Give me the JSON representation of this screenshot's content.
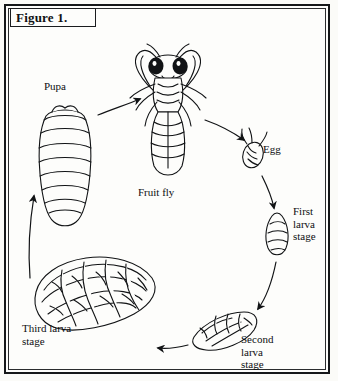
{
  "figure": {
    "label": "Figure 1."
  },
  "diagram": {
    "type": "life-cycle",
    "stages": [
      {
        "id": "pupa",
        "label": "Pupa",
        "x": 62,
        "y": 88
      },
      {
        "id": "fruit-fly",
        "label": "Fruit fly",
        "x": 162,
        "y": 192
      },
      {
        "id": "egg",
        "label": "Egg",
        "x": 272,
        "y": 149
      },
      {
        "id": "first-larva",
        "label": "First\nlarva\nstage",
        "x": 305,
        "y": 212
      },
      {
        "id": "second-larva",
        "label": "Second\nlarva\nstage",
        "x": 262,
        "y": 340
      },
      {
        "id": "third-larva",
        "label": "Third larva\nstage",
        "x": 52,
        "y": 329
      }
    ],
    "arrows": [
      {
        "from": "pupa",
        "to": "fruit-fly"
      },
      {
        "from": "fruit-fly",
        "to": "egg"
      },
      {
        "from": "egg",
        "to": "first-larva"
      },
      {
        "from": "first-larva",
        "to": "second-larva"
      },
      {
        "from": "second-larva",
        "to": "third-larva"
      },
      {
        "from": "third-larva",
        "to": "pupa"
      }
    ],
    "colors": {
      "ink": "#111315",
      "paper": "#fdfdfb"
    }
  }
}
